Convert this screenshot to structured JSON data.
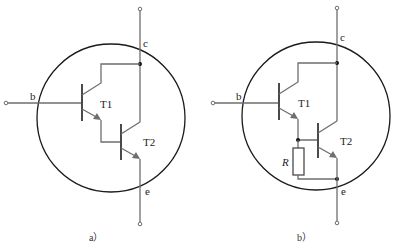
{
  "figure": {
    "type": "darlington-transistor-circuit",
    "panels": [
      {
        "id": "a",
        "caption": "a）",
        "terminals": {
          "base": "b",
          "collector": "c",
          "emitter": "e"
        },
        "transistors": [
          "T1",
          "T2"
        ],
        "has_resistor": false
      },
      {
        "id": "b",
        "caption": "b）",
        "terminals": {
          "base": "b",
          "collector": "c",
          "emitter": "e"
        },
        "transistors": [
          "T1",
          "T2"
        ],
        "has_resistor": true,
        "resistor_label": "R"
      }
    ]
  },
  "colors": {
    "wire": "#6e6e6e",
    "circle": "#1a1a1a",
    "text": "#222222",
    "background": "#ffffff"
  }
}
